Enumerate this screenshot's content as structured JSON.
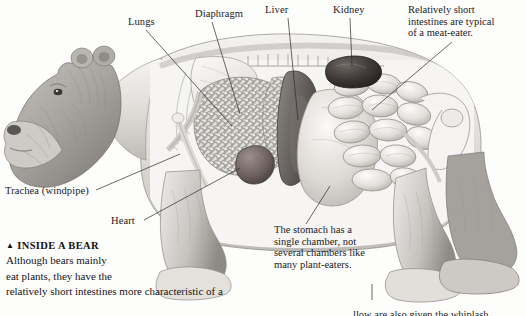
{
  "figure": {
    "style": "grayscale pencil illustration",
    "background_color": "#fdfdfc",
    "ink_color": "#1b1b1b"
  },
  "labels": {
    "lungs": "Lungs",
    "diaphragm": "Diaphragm",
    "liver": "Liver",
    "kidney": "Kidney",
    "trachea": "Trachea (windpipe)",
    "heart": "Heart"
  },
  "notes": {
    "intestines": {
      "line1": "Relatively short",
      "line2": "intestines are typical",
      "line3": "of a meat-eater."
    },
    "stomach": {
      "line1": "The stomach has a",
      "line2": "single chamber, not",
      "line3": "several chambers like",
      "line4": "many plant-eaters."
    },
    "bottom_cut": "llow are also given the whiplash"
  },
  "caption": {
    "marker": "▲",
    "title": "INSIDE A BEAR",
    "line1": "Although bears mainly",
    "line2": "eat plants, they have the",
    "line3": "relatively short intestines more characteristic of a"
  },
  "colors": {
    "fur_light": "#e9e7e4",
    "fur_mid": "#c9c6c2",
    "fur_dark": "#9b9894",
    "organ_pale": "#eceae6",
    "organ_mottle": "#b8b5b0",
    "organ_dark": "#6f6a66",
    "heart": "#6b5f5c",
    "kidney": "#4f4946",
    "bone": "#f2f1ee"
  }
}
